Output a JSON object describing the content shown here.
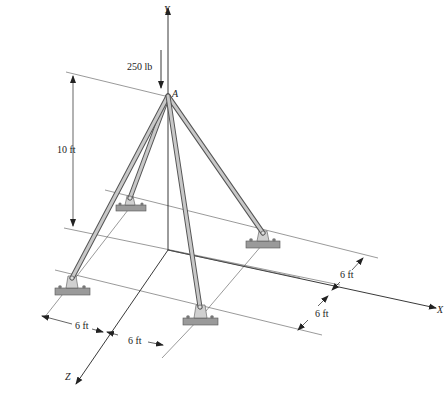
{
  "figure": {
    "load": {
      "value_label": "250 lb",
      "point_label": "A"
    },
    "axes": {
      "y_label": "Y",
      "x_label": "X",
      "z_label": "Z"
    },
    "dimensions": {
      "height": "10 ft",
      "x_left": "6 ft",
      "x_right": "6 ft",
      "z_upper": "6 ft",
      "z_lower": "6 ft"
    },
    "supports": [
      {
        "id": "back-left"
      },
      {
        "id": "right"
      },
      {
        "id": "front-left"
      },
      {
        "id": "front-center"
      }
    ],
    "colors": {
      "member_fill": "#c8c8c8",
      "member_edge": "#555555",
      "base_fill": "#9a9a9a",
      "line": "#222222"
    }
  }
}
